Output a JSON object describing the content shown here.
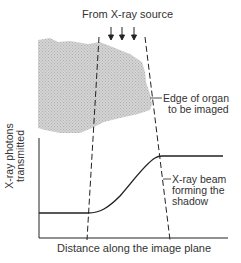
{
  "diagram": {
    "title": "From X-ray source",
    "labels": {
      "edge_line1": "Edge of organ",
      "edge_line2": "to be imaged",
      "beam_line1": "X-ray beam",
      "beam_line2": "forming the",
      "beam_line3": "shadow"
    },
    "axes": {
      "xlabel": "Distance along the image plane",
      "ylabel_line1": "X-ray photons",
      "ylabel_line2": "transmitted"
    },
    "arrows_count": 3,
    "colors": {
      "organ_fill": "#c8c8c8",
      "line": "#222222"
    }
  }
}
